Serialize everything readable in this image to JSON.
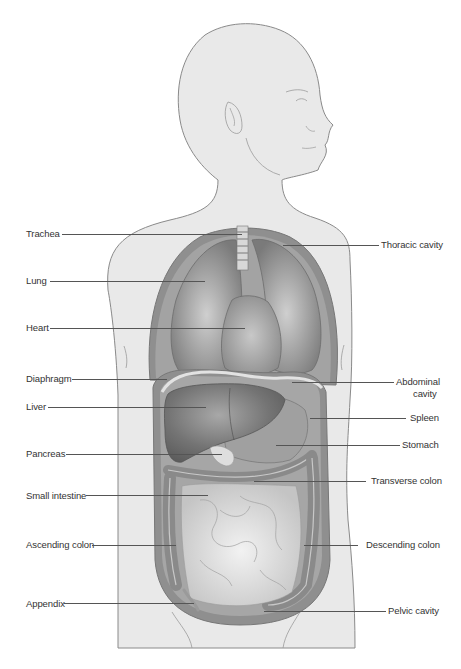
{
  "diagram": {
    "type": "anatomical-illustration",
    "colors": {
      "body_fill": "#e9e9e9",
      "body_outline": "#8a8a8a",
      "cavity_wall": "#8d8d8d",
      "organ_dark": "#6e6e6e",
      "organ_mid": "#9a9a9a",
      "organ_light": "#d6d6d6",
      "label_text": "#333333",
      "leader_line": "#555555"
    },
    "labels_left": [
      {
        "id": "trachea",
        "text": "Trachea"
      },
      {
        "id": "lung",
        "text": "Lung"
      },
      {
        "id": "heart",
        "text": "Heart"
      },
      {
        "id": "diaphragm",
        "text": "Diaphragm"
      },
      {
        "id": "liver",
        "text": "Liver"
      },
      {
        "id": "pancreas",
        "text": "Pancreas"
      },
      {
        "id": "small-intestine",
        "text": "Small intestine"
      },
      {
        "id": "ascending-colon",
        "text": "Ascending  colon"
      },
      {
        "id": "appendix",
        "text": "Appendix"
      }
    ],
    "labels_right": [
      {
        "id": "thoracic-cavity",
        "text": "Thoracic cavity"
      },
      {
        "id": "abdominal-cavity",
        "text": "Abdominal",
        "text2": "cavity"
      },
      {
        "id": "spleen",
        "text": "Spleen"
      },
      {
        "id": "stomach",
        "text": "Stomach"
      },
      {
        "id": "transverse-colon",
        "text": "Transverse colon"
      },
      {
        "id": "descending-colon",
        "text": "Descending  colon"
      },
      {
        "id": "pelvic-cavity",
        "text": "Pelvic cavity"
      }
    ]
  }
}
